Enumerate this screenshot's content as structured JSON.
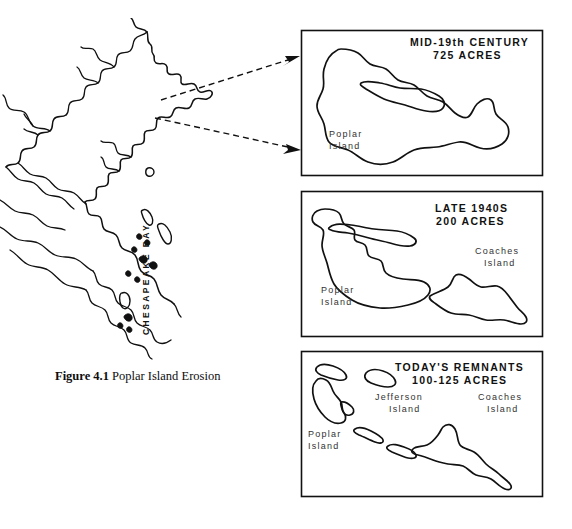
{
  "figure": {
    "caption_label": "Figure 4.1",
    "caption_text": "Poplar Island Erosion"
  },
  "bay_map": {
    "label": "CHESAPEAKE BAY",
    "name": "chesapeake-bay-outline-map",
    "callout_arrows": 2
  },
  "panels": [
    {
      "id": "mid-19th-century",
      "title_line1": "MID-19th CENTURY",
      "title_line2": "725 ACRES",
      "labels": [
        {
          "id": "poplar",
          "line1": "Poplar",
          "line2": "Island"
        }
      ]
    },
    {
      "id": "late-1940s",
      "title_line1": "LATE 1940S",
      "title_line2": "200 ACRES",
      "labels": [
        {
          "id": "poplar",
          "line1": "Poplar",
          "line2": "Island"
        },
        {
          "id": "coaches",
          "line1": "Coaches",
          "line2": "Island"
        }
      ]
    },
    {
      "id": "todays-remnants",
      "title_line1": "TODAY'S REMNANTS",
      "title_line2": "100-125 ACRES",
      "labels": [
        {
          "id": "poplar",
          "line1": "Poplar",
          "line2": "Island"
        },
        {
          "id": "jefferson",
          "line1": "Jefferson",
          "line2": "Island"
        },
        {
          "id": "coaches",
          "line1": "Coaches",
          "line2": "Island"
        }
      ]
    }
  ],
  "colors": {
    "ink": "#111111",
    "paper": "#ffffff",
    "label_ink": "#333333"
  }
}
